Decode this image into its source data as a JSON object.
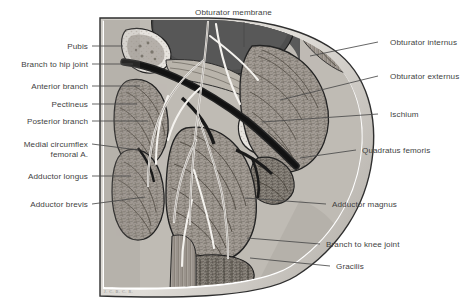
{
  "figure": {
    "signature": "J. C. B. C. R.",
    "colors": {
      "background": "#ffffff",
      "label_text": "#3f3f3f",
      "leader_line": "#4a4a4a",
      "pelvic_cavity_dark": "#555555",
      "bone_light": "#e8e6e2",
      "muscle_mid": "#9a958e",
      "vessel_dark": "#2b2b2b",
      "nerve_light": "#f2f0ec",
      "outer_skin": "#d8d5d0"
    }
  },
  "labels": {
    "top": [
      {
        "id": "obturator-membrane",
        "text": "Obturator membrane",
        "x": 195,
        "y": 8,
        "line": {
          "x1": 244,
          "y1": 22,
          "x2": 244,
          "y2": 47
        }
      }
    ],
    "left": [
      {
        "id": "pubis",
        "text": "Pubis",
        "x": 8,
        "y": 42,
        "line": {
          "x1": 92,
          "y1": 46,
          "x2": 123,
          "y2": 46
        }
      },
      {
        "id": "branch-to-hip-joint",
        "text": "Branch to hip joint",
        "x": 8,
        "y": 60,
        "line": {
          "x1": 92,
          "y1": 64,
          "x2": 133,
          "y2": 64
        }
      },
      {
        "id": "anterior-branch",
        "text": "Anterior branch",
        "x": 8,
        "y": 82,
        "line": {
          "x1": 92,
          "y1": 86,
          "x2": 140,
          "y2": 86
        }
      },
      {
        "id": "pectineus",
        "text": "Pectineus",
        "x": 8,
        "y": 100,
        "line": {
          "x1": 92,
          "y1": 104,
          "x2": 137,
          "y2": 104
        }
      },
      {
        "id": "posterior-branch",
        "text": "Posterior branch",
        "x": 8,
        "y": 117,
        "line": {
          "x1": 92,
          "y1": 121,
          "x2": 148,
          "y2": 121
        }
      },
      {
        "id": "medial-circumflex-femoral",
        "text": "Medial circumflex",
        "x": 8,
        "y": 140,
        "text2": "femoral A.",
        "line": {
          "x1": 92,
          "y1": 144,
          "x2": 138,
          "y2": 150
        }
      },
      {
        "id": "adductor-longus",
        "text": "Adductor longus",
        "x": 8,
        "y": 172,
        "line": {
          "x1": 92,
          "y1": 176,
          "x2": 131,
          "y2": 176
        }
      },
      {
        "id": "adductor-brevis",
        "text": "Adductor brevis",
        "x": 8,
        "y": 200,
        "line": {
          "x1": 92,
          "y1": 204,
          "x2": 145,
          "y2": 197
        }
      }
    ],
    "right": [
      {
        "id": "obturator-internus",
        "text": "Obturator internus",
        "x": 390,
        "y": 38,
        "line": {
          "x1": 378,
          "y1": 42,
          "x2": 310,
          "y2": 56
        }
      },
      {
        "id": "obturator-externus",
        "text": "Obturator externus",
        "x": 390,
        "y": 72,
        "line": {
          "x1": 378,
          "y1": 76,
          "x2": 280,
          "y2": 100
        }
      },
      {
        "id": "ischium",
        "text": "Ischium",
        "x": 390,
        "y": 110,
        "line": {
          "x1": 378,
          "y1": 114,
          "x2": 262,
          "y2": 122
        }
      },
      {
        "id": "quadratus-femoris",
        "text": "Quadratus femoris",
        "x": 360,
        "y": 146,
        "line": {
          "x1": 356,
          "y1": 150,
          "x2": 300,
          "y2": 158
        }
      },
      {
        "id": "adductor-magnus",
        "text": "Adductor magnus",
        "x": 328,
        "y": 200,
        "line": {
          "x1": 326,
          "y1": 204,
          "x2": 245,
          "y2": 198
        }
      },
      {
        "id": "branch-to-knee-joint",
        "text": "Branch to knee joint",
        "x": 322,
        "y": 240,
        "line": {
          "x1": 320,
          "y1": 244,
          "x2": 247,
          "y2": 238
        }
      },
      {
        "id": "gracilis",
        "text": "Gracilis",
        "x": 332,
        "y": 262,
        "line": {
          "x1": 330,
          "y1": 266,
          "x2": 250,
          "y2": 258
        }
      }
    ]
  }
}
